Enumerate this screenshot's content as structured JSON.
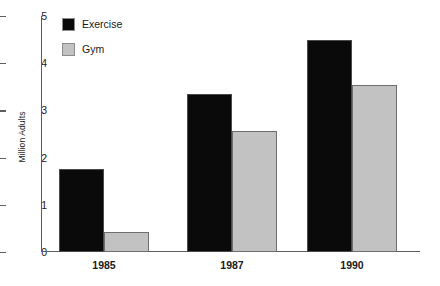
{
  "chart_data": {
    "type": "bar",
    "title": "",
    "subtitle": "",
    "xlabel": "",
    "ylabel": "Million Adults",
    "categories": [
      "1985",
      "1987",
      "1990"
    ],
    "series": [
      {
        "name": "Exercise",
        "color": "#0a0a0a",
        "values": [
          1.75,
          3.35,
          4.5
        ]
      },
      {
        "name": "Gym",
        "color": "#c2c2c2",
        "values": [
          0.43,
          2.57,
          3.53
        ]
      }
    ],
    "ylim": [
      0,
      5
    ],
    "ytick_labels": [
      "0",
      "1",
      "2",
      "3",
      "4",
      "5"
    ],
    "ytick_values": [
      0,
      1,
      2,
      3,
      4,
      5
    ],
    "grid": false,
    "legend_position": "top-left-inside"
  },
  "legend": {
    "items": [
      {
        "label": "Exercise",
        "swatch": "black-square-swatch"
      },
      {
        "label": "Gym",
        "swatch": "gray-square-swatch"
      }
    ]
  },
  "colors": {
    "exercise": "#0a0a0a",
    "gym": "#c2c2c2",
    "axis": "#5d5d5d",
    "text": "#1a1a1a",
    "background": "#ffffff"
  }
}
